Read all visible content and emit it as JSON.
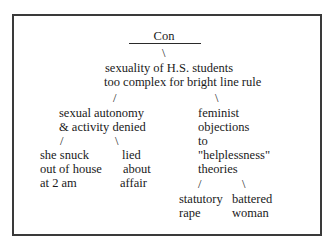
{
  "title": "Con",
  "root": {
    "lines": [
      "sexuality of H.S. students",
      "too complex for bright line rule"
    ]
  },
  "branches": {
    "left": {
      "lines": [
        "sexual autonomy",
        "& activity denied"
      ],
      "children": [
        {
          "lines": [
            "she snuck",
            "out of house",
            "at 2 am"
          ]
        },
        {
          "lines": [
            "lied",
            "about",
            "affair"
          ]
        }
      ]
    },
    "right": {
      "lines": [
        "feminist",
        "objections",
        "to",
        "\"helplessness\"",
        "theories"
      ],
      "children": [
        {
          "lines": [
            "statutory",
            "rape"
          ]
        },
        {
          "lines": [
            "battered",
            "woman"
          ]
        }
      ]
    }
  },
  "connectors": {
    "down": "\\",
    "left": "/",
    "right": "\\"
  }
}
